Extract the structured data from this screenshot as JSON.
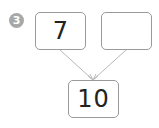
{
  "problem_number": "3",
  "boxes": {
    "top_left": "7",
    "top_right": "",
    "bottom": "10"
  },
  "colors": {
    "badge": "#a8a8a8",
    "box_border": "#9a9a9a",
    "arrow": "#b0b0b0"
  }
}
